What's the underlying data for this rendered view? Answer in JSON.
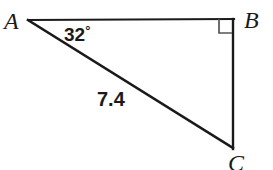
{
  "figure": {
    "type": "right-triangle-diagram",
    "background_color": "#ffffff",
    "stroke_color": "#1a1a1a",
    "right_angle_mark_color": "#555555",
    "vertices": {
      "a": {
        "label": "A",
        "x": 28,
        "y": 20
      },
      "b": {
        "label": "B",
        "x": 233,
        "y": 19
      },
      "c": {
        "label": "C",
        "x": 233,
        "y": 148
      }
    },
    "sides": [
      {
        "name": "AB",
        "from": "a",
        "to": "b",
        "label": ""
      },
      {
        "name": "BC",
        "from": "b",
        "to": "c",
        "label": ""
      },
      {
        "name": "AC",
        "from": "a",
        "to": "c",
        "label": "7.4"
      }
    ],
    "angles": [
      {
        "at": "a",
        "value": "32",
        "unit": "°",
        "label": "32°"
      },
      {
        "at": "b",
        "value": "90",
        "unit": "°",
        "label": "",
        "marker": "right-angle-square"
      }
    ],
    "measure_labels": {
      "angle_a": "32",
      "degree_symbol": "°",
      "side_ac": "7.4"
    }
  }
}
